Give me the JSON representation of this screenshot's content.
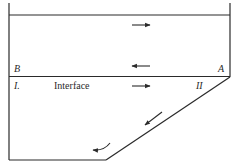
{
  "diagram": {
    "type": "flow-schematic",
    "labels": {
      "point_b": "B",
      "point_a": "A",
      "region_i": "I.",
      "region_ii": "II",
      "interface": "Interface"
    },
    "flow_arrows": [
      {
        "id": "upper-layer-top",
        "direction": "right"
      },
      {
        "id": "upper-layer-bottom",
        "direction": "left"
      },
      {
        "id": "lower-layer-top",
        "direction": "right"
      },
      {
        "id": "lower-layer-diagonal",
        "direction": "down-left"
      },
      {
        "id": "lower-layer-bottom",
        "direction": "left-curved"
      }
    ],
    "colors": {
      "stroke": "#2a2a2a",
      "background": "#ffffff"
    }
  }
}
